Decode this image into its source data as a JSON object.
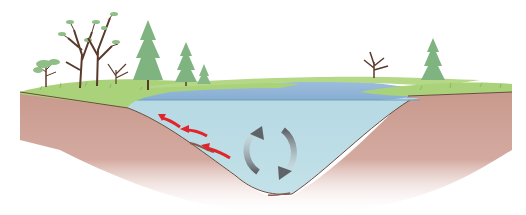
{
  "diagram": {
    "colors": {
      "background": "#ffffff",
      "sky": "#ffffff",
      "grass": "#a9d27a",
      "grass_dark": "#8fc05e",
      "water_surface": "#8fb4d6",
      "water_body": "#bcdde6",
      "soil": "#c99a8e",
      "soil_edge": "#6e4a3e",
      "conifer": "#7fb37f",
      "trunk": "#5a3a2a",
      "arrow_red": "#e0262a",
      "arrow_gray": "#6f7073"
    },
    "elements": {
      "red_arrows": {
        "count": 3,
        "direction": "up-slope toward left shore",
        "meaning": "water flow along bottom"
      },
      "circulation_arrows": {
        "count": 2,
        "style": "gray curved arrows forming a loop",
        "meaning": "water mixing / turnover"
      },
      "trees_left": [
        "small bushy tree",
        "tall bare deciduous tree",
        "tall bare deciduous tree",
        "small bare shrub",
        "conifer",
        "conifer",
        "small conifer"
      ],
      "trees_right": [
        "small bare tree",
        "conifer"
      ]
    }
  }
}
